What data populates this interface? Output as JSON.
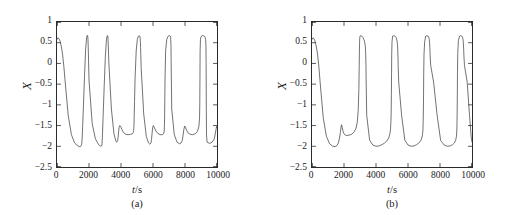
{
  "figure": {
    "width": 511,
    "height": 215,
    "background": "#ffffff",
    "line_color": "#333333",
    "axis_color": "#2b2b2b"
  },
  "chart_data": [
    {
      "type": "line",
      "panel_id": "a",
      "caption": "(a)",
      "title": "",
      "xlabel": "t/s",
      "xlabel_symbol": "t",
      "xlabel_unit": "s",
      "ylabel": "X",
      "xlim": [
        0,
        10000
      ],
      "ylim": [
        -2.5,
        1
      ],
      "xticks": [
        0,
        2000,
        4000,
        6000,
        8000,
        10000
      ],
      "xticklabels": [
        "0",
        "2000",
        "4000",
        "6000",
        "8000",
        "10000"
      ],
      "yticks": [
        1,
        0.5,
        0,
        -0.5,
        -1,
        -1.5,
        -2,
        -2.5
      ],
      "yticklabels": [
        "1",
        "0.5",
        "0",
        "−0.5",
        "−1",
        "−1.5",
        "−2",
        "−2.5"
      ],
      "grid": false,
      "legend": null,
      "series": [
        {
          "name": "X(t)",
          "color": "#333333",
          "x": [
            0,
            60,
            120,
            180,
            240,
            300,
            360,
            430,
            500,
            700,
            900,
            1100,
            1300,
            1420,
            1490,
            1520,
            1540,
            1550,
            1560,
            1575,
            1600,
            1650,
            1720,
            1790,
            1850,
            1880,
            1900,
            1915,
            1925,
            1935,
            1945,
            1960,
            2000,
            2200,
            2400,
            2600,
            2700,
            2760,
            2790,
            2805,
            2815,
            2825,
            2845,
            2880,
            2950,
            3020,
            3080,
            3120,
            3145,
            3160,
            3172,
            3182,
            3192,
            3205,
            3240,
            3400,
            3560,
            3680,
            3740,
            3790,
            3820,
            3850,
            3880,
            3920,
            3980,
            4060,
            4160,
            4300,
            4450,
            4600,
            4700,
            4760,
            4790,
            4805,
            4815,
            4825,
            4845,
            4880,
            4950,
            5020,
            5090,
            5140,
            5170,
            5188,
            5200,
            5212,
            5225,
            5260,
            5420,
            5580,
            5720,
            5800,
            5870,
            5905,
            5940,
            5975,
            6020,
            6090,
            6180,
            6300,
            6440,
            6580,
            6660,
            6700,
            6715,
            6725,
            6735,
            6755,
            6790,
            6860,
            6930,
            7000,
            7050,
            7080,
            7098,
            7110,
            7122,
            7135,
            7170,
            7330,
            7500,
            7650,
            7750,
            7830,
            7880,
            7930,
            7980,
            8030,
            8100,
            8200,
            8330,
            8480,
            8640,
            8780,
            8870,
            8910,
            8925,
            8935,
            8945,
            8965,
            9000,
            9070,
            9140,
            9210,
            9260,
            9290,
            9308,
            9320,
            9332,
            9345,
            9380,
            9540,
            9700,
            9830,
            9900,
            9950,
            9980,
            10000
          ],
          "y": [
            0.58,
            0.62,
            0.6,
            0.55,
            0.46,
            0.34,
            0.18,
            -0.08,
            -0.4,
            -1.25,
            -1.72,
            -1.92,
            -1.99,
            -2.01,
            -2.0,
            -1.98,
            -1.95,
            -1.92,
            -1.88,
            -1.78,
            -1.55,
            -1.05,
            -0.3,
            0.35,
            0.62,
            0.67,
            0.68,
            0.67,
            0.64,
            0.58,
            0.48,
            0.28,
            -0.4,
            -1.45,
            -1.82,
            -1.96,
            -1.99,
            -2.0,
            -1.99,
            -1.97,
            -1.93,
            -1.86,
            -1.68,
            -1.3,
            -0.55,
            0.15,
            0.52,
            0.64,
            0.67,
            0.67,
            0.66,
            0.63,
            0.57,
            0.44,
            0.02,
            -1.1,
            -1.7,
            -1.88,
            -1.9,
            -1.86,
            -1.78,
            -1.65,
            -1.55,
            -1.5,
            -1.52,
            -1.6,
            -1.67,
            -1.71,
            -1.72,
            -1.71,
            -1.7,
            -1.67,
            -1.62,
            -1.54,
            -1.44,
            -1.28,
            -0.92,
            -0.35,
            0.3,
            0.58,
            0.66,
            0.67,
            0.66,
            0.64,
            0.6,
            0.53,
            0.38,
            -0.1,
            -1.22,
            -1.76,
            -1.92,
            -1.95,
            -1.92,
            -1.84,
            -1.7,
            -1.56,
            -1.5,
            -1.55,
            -1.63,
            -1.69,
            -1.72,
            -1.72,
            -1.7,
            -1.63,
            -1.5,
            -1.3,
            -0.95,
            -0.3,
            0.32,
            0.58,
            0.65,
            0.67,
            0.67,
            0.66,
            0.63,
            0.57,
            0.44,
            0.02,
            -1.1,
            -1.72,
            -1.9,
            -1.94,
            -1.92,
            -1.86,
            -1.73,
            -1.59,
            -1.51,
            -1.54,
            -1.62,
            -1.68,
            -1.71,
            -1.72,
            -1.7,
            -1.64,
            -1.52,
            -1.32,
            -0.98,
            -0.32,
            0.3,
            0.57,
            0.65,
            0.67,
            0.67,
            0.66,
            0.63,
            0.57,
            0.44,
            0.02,
            -1.12,
            -1.73,
            -1.9,
            -1.93,
            -1.9,
            -1.82,
            -1.68,
            -1.57,
            -1.52,
            -1.55
          ]
        }
      ],
      "features": {
        "spike_times": [
          1550,
          2810,
          4810,
          6730,
          8940
        ],
        "subthreshold_bump_times": [
          3850,
          5905,
          7980,
          9960
        ],
        "spike_peak": 0.67,
        "baseline_min": -2.0,
        "bump_peak": -1.5
      }
    },
    {
      "type": "line",
      "panel_id": "b",
      "caption": "(b)",
      "title": "",
      "xlabel": "t/s",
      "xlabel_symbol": "t",
      "xlabel_unit": "s",
      "ylabel": "X",
      "xlim": [
        0,
        10000
      ],
      "ylim": [
        -2.5,
        1
      ],
      "xticks": [
        0,
        2000,
        4000,
        6000,
        8000,
        10000
      ],
      "xticklabels": [
        "0",
        "2000",
        "4000",
        "6000",
        "8000",
        "10000"
      ],
      "yticks": [
        1,
        0.5,
        0,
        -0.5,
        -1,
        -1.5,
        -2,
        -2.5
      ],
      "yticklabels": [
        "1",
        "0.5",
        "0",
        "−0.5",
        "−1",
        "−1.5",
        "−2",
        "−2.5"
      ],
      "grid": false,
      "legend": null,
      "series": [
        {
          "name": "X(t)",
          "color": "#333333",
          "x": [
            0,
            60,
            120,
            180,
            240,
            300,
            360,
            430,
            500,
            700,
            900,
            1100,
            1300,
            1450,
            1560,
            1650,
            1720,
            1780,
            1820,
            1850,
            1890,
            1940,
            2000,
            2080,
            2180,
            2320,
            2480,
            2620,
            2740,
            2830,
            2890,
            2930,
            2950,
            2962,
            2972,
            2982,
            3000,
            3040,
            3110,
            3180,
            3250,
            3300,
            3330,
            3348,
            3360,
            3372,
            3385,
            3420,
            3600,
            3800,
            4000,
            4200,
            4380,
            4540,
            4680,
            4790,
            4860,
            4905,
            4935,
            4950,
            4962,
            4972,
            4982,
            5000,
            5040,
            5110,
            5180,
            5250,
            5300,
            5330,
            5348,
            5360,
            5372,
            5385,
            5420,
            5600,
            5800,
            6000,
            6200,
            6380,
            6540,
            6680,
            6790,
            6860,
            6905,
            6935,
            6950,
            6962,
            6972,
            6982,
            7000,
            7040,
            7110,
            7180,
            7250,
            7300,
            7330,
            7348,
            7360,
            7372,
            7385,
            7420,
            7600,
            7820,
            8040,
            8260,
            8460,
            8640,
            8790,
            8900,
            8975,
            9020,
            9045,
            9060,
            9072,
            9082,
            9092,
            9110,
            9150,
            9220,
            9290,
            9360,
            9410,
            9440,
            9458,
            9470,
            9482,
            9495,
            9530,
            9700,
            9850,
            9950,
            10000
          ],
          "y": [
            0.58,
            0.62,
            0.6,
            0.55,
            0.46,
            0.34,
            0.18,
            -0.08,
            -0.42,
            -1.3,
            -1.76,
            -1.94,
            -2.0,
            -2.01,
            -1.98,
            -1.92,
            -1.8,
            -1.65,
            -1.52,
            -1.48,
            -1.55,
            -1.64,
            -1.7,
            -1.73,
            -1.74,
            -1.73,
            -1.71,
            -1.66,
            -1.58,
            -1.42,
            -1.12,
            -0.6,
            -0.1,
            0.25,
            0.48,
            0.6,
            0.66,
            0.67,
            0.66,
            0.63,
            0.57,
            0.5,
            0.42,
            0.32,
            0.18,
            -0.05,
            -0.45,
            -1.25,
            -1.85,
            -1.97,
            -2.0,
            -1.99,
            -1.96,
            -1.92,
            -1.87,
            -1.8,
            -1.72,
            -1.6,
            -1.38,
            -1.15,
            -0.75,
            -0.25,
            0.22,
            0.52,
            0.66,
            0.67,
            0.66,
            0.63,
            0.57,
            0.5,
            0.42,
            0.32,
            0.18,
            -0.05,
            -0.45,
            -1.25,
            -1.85,
            -1.97,
            -2.0,
            -1.99,
            -1.96,
            -1.92,
            -1.87,
            -1.8,
            -1.72,
            -1.6,
            -1.38,
            -1.15,
            -0.75,
            -0.25,
            0.22,
            0.52,
            0.66,
            0.67,
            0.66,
            0.63,
            0.57,
            0.5,
            0.42,
            0.32,
            0.18,
            -0.05,
            -0.45,
            -1.25,
            -1.86,
            -1.97,
            -2.0,
            -1.99,
            -1.96,
            -1.92,
            -1.86,
            -1.78,
            -1.68,
            -1.5,
            -1.22,
            -0.78,
            -0.25,
            0.25,
            0.55,
            0.66,
            0.67,
            0.66,
            0.63,
            0.57,
            0.5,
            0.42,
            0.32,
            0.18,
            -0.05,
            -0.45,
            -1.28,
            -1.78,
            -1.9,
            -1.93
          ]
        }
      ],
      "features": {
        "spike_times": [
          2960,
          4960,
          6960,
          9070
        ],
        "subthreshold_bump_times": [
          1830
        ],
        "spike_peak": 0.67,
        "baseline_min": -2.0,
        "bump_peak": -1.48
      }
    }
  ]
}
